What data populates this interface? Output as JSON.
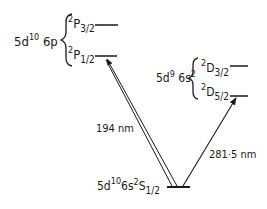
{
  "diagram": {
    "type": "energy-level-diagram",
    "configurations": {
      "p_config": {
        "base": "5d",
        "sup1": "10",
        "mid": " 6p"
      },
      "d_config": {
        "base": "5d",
        "sup1": "9",
        "mid": " 6s",
        "sup2": "2"
      },
      "ground_config": {
        "base": "5d",
        "sup1": "10",
        "mid": "6s",
        "sup2": "2",
        "term": "S",
        "sub": "1/2"
      }
    },
    "levels": {
      "p32": {
        "mult": "2",
        "term": "P",
        "j": "3/2"
      },
      "p12": {
        "mult": "2",
        "term": "P",
        "j": "1/2"
      },
      "d32": {
        "mult": "2",
        "term": "D",
        "j": "3/2"
      },
      "d52": {
        "mult": "2",
        "term": "D",
        "j": "5/2"
      }
    },
    "transitions": [
      {
        "from": "5d10 6s2 2S1/2",
        "to": "5d10 6p 2P1/2",
        "label": "194 nm"
      },
      {
        "from": "5d10 6s2 2S1/2",
        "to": "5d9 6s2 2D5/2",
        "label": "281·5 nm"
      }
    ],
    "colors": {
      "ink": "#1a1a1a",
      "background": "#ffffff"
    }
  }
}
